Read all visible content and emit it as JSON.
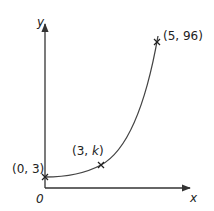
{
  "diagram": {
    "type": "exponential-curve-sketch",
    "axes": {
      "x_label": "x",
      "y_label": "y",
      "origin_label": "0"
    },
    "points": [
      {
        "label": "(0, 3)",
        "x": 0,
        "y": 3
      },
      {
        "label_prefix": "(3, ",
        "label_var": "k",
        "label_suffix": ")",
        "x": 3,
        "y": "k"
      },
      {
        "label": "(5, 96)",
        "x": 5,
        "y": 96
      }
    ],
    "colors": {
      "axis": "#333333",
      "curve": "#444444",
      "text": "#222222"
    }
  }
}
